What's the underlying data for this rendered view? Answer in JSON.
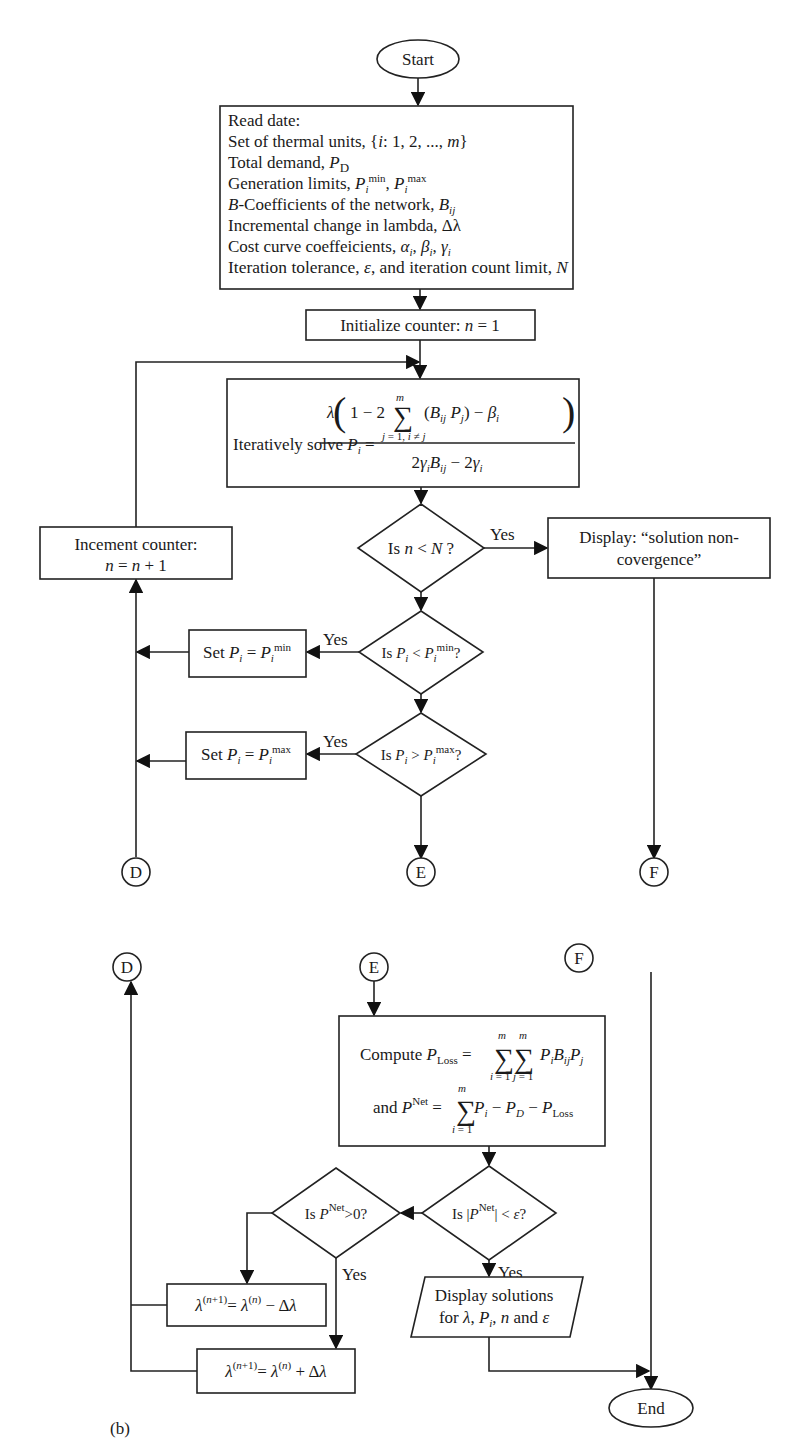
{
  "figure": {
    "label": "(b)",
    "part_a": {
      "start": "Start",
      "read_data": {
        "title": "Read date:",
        "lines": [
          "Set of thermal units, {i: 1, 2, ..., m}",
          "Total demand, P_D",
          "Generation limits, P_i^min, P_i^max",
          "B-Coefficients of the network, B_ij",
          "Incremental change in lambda, Δλ",
          "Cost curve coeffeicients, α_i, β_i, γ_i",
          "Iteration tolerance, ε, and iteration count limit, N"
        ],
        "line_parts": [
          {
            "pre": "Set of thermal units, {",
            "it": "i",
            "post": ": 1, 2, ..., ",
            "it2": "m",
            "post2": "}"
          },
          {
            "pre": "Total demand, ",
            "it": "P",
            "sub": "D"
          },
          {
            "pre": "Generation limits, "
          },
          {
            "pre": "",
            "it": "B",
            "post": "-Coefficients of the network, ",
            "it2": "B",
            "sub2": "ij"
          },
          {
            "pre": "Incremental change in lambda, Δλ"
          },
          {
            "pre": "Cost curve coeffeicients, ",
            "it": "α",
            "sub": "i",
            "it2": "β",
            "sub2": "i",
            "it3": "γ",
            "sub3": "i"
          },
          {
            "pre": "Iteration tolerance, ",
            "it": "ε",
            "post": ", and iteration count limit, ",
            "it2": "N"
          }
        ]
      },
      "initialize": "Initialize counter: n = 1",
      "initialize_parts": {
        "pre": "Initialize counter: ",
        "var": "n",
        "post": " = 1"
      },
      "solve": {
        "prefix": "Iteratively solve",
        "lhs": "P_i",
        "numerator": "λ(1 − 2 Σ_{j=1, i≠j}^{m} (B_ij P_j) − β_i)",
        "denominator": "2γ_i B_ij − 2γ_i"
      },
      "increment": {
        "line1": "Incement counter:",
        "line2": "n = n + 1"
      },
      "decision_n": {
        "text": "Is n < N ?",
        "yes": "Yes"
      },
      "nonconvergence": {
        "line1": "Display: “solution non-",
        "line2": "covergence”"
      },
      "decision_min": {
        "text": "Is P_i < P_i^min?",
        "yes": "Yes"
      },
      "set_min": "Set P_i = P_i^min",
      "decision_max": {
        "text": "Is P_i > P_i^max?",
        "yes": "Yes"
      },
      "set_max": "Set P_i = P_i^max",
      "connectors": [
        "D",
        "E",
        "F"
      ]
    },
    "part_b": {
      "connectors": [
        "D",
        "E",
        "F"
      ],
      "compute": {
        "line1": "Compute P_Loss = Σ_{i=1}^{m} Σ_{j=1}^{m} P_i B_ij P_j",
        "line2": "and P^Net = Σ_{i=1}^{m} P_i − P_D − P_Loss"
      },
      "decision_eps": {
        "text": "Is |P^Net| < ε?",
        "yes": "Yes"
      },
      "decision_pos": {
        "text": "Is P^Net > 0?",
        "yes": "Yes"
      },
      "lambda_minus": "λ^(n+1) = λ^(n) − Δλ",
      "lambda_plus": "λ^(n+1) = λ^(n) + Δλ",
      "display_solutions": {
        "line1": "Display solutions",
        "line2": "for λ, P_i, n and ε"
      },
      "end": "End"
    }
  }
}
